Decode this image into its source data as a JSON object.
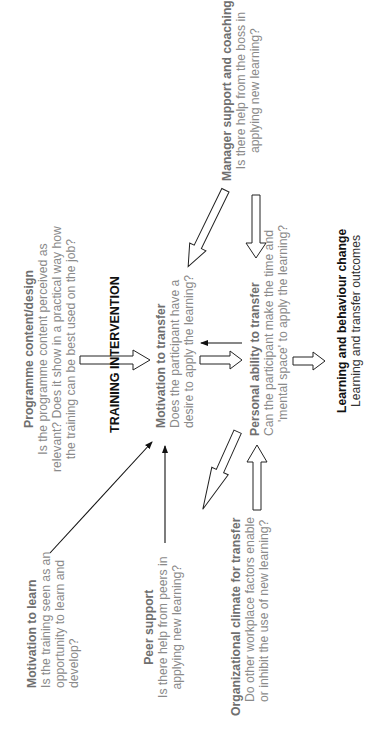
{
  "diagram": {
    "heading": "TRAINING INTERVENTION",
    "nodes": {
      "programme": {
        "title": "Programme content/design",
        "lines": [
          "Is the programme content perceived as",
          "relevant? Does it show in a practical way how",
          "the training can be best used on the job?"
        ]
      },
      "motivation_learn": {
        "title": "Motivation to learn",
        "lines": [
          "Is the training seen as an",
          "opportunity to learn and",
          "develop?"
        ]
      },
      "peer": {
        "title": "Peer support",
        "lines": [
          "Is there help from peers in",
          "applying new learning?"
        ]
      },
      "org_climate": {
        "title": "Organizational climate for transfer",
        "lines": [
          "Do other workplace factors enable",
          "or inhibit the use of new learning?"
        ]
      },
      "motivation_transfer": {
        "title": "Motivation to transfer",
        "lines": [
          "Does the participant have a",
          "desire to apply the learning?"
        ]
      },
      "personal": {
        "title": "Personal ability to transfer",
        "lines": [
          "Can the participant make the time and",
          "'mental space' to apply the learning?"
        ]
      },
      "manager": {
        "title": "Manager support and coaching",
        "lines": [
          "Is there help from the boss in",
          "applying new learning?"
        ]
      },
      "outcome": {
        "title": "Learning and behaviour change",
        "lines": [
          "Learning and transfer outcomes"
        ]
      }
    },
    "edges": [
      {
        "from": "programme",
        "to": "motivation_transfer",
        "style": "hollow"
      },
      {
        "from": "motivation_learn",
        "to": "motivation_transfer",
        "style": "thin"
      },
      {
        "from": "peer",
        "to": "motivation_transfer",
        "style": "thin"
      },
      {
        "from": "org_climate",
        "to": "motivation_transfer",
        "style": "hollow"
      },
      {
        "from": "org_climate",
        "to": "personal",
        "style": "hollow"
      },
      {
        "from": "manager",
        "to": "motivation_transfer",
        "style": "hollow"
      },
      {
        "from": "manager",
        "to": "personal",
        "style": "hollow"
      },
      {
        "from": "motivation_transfer",
        "to": "personal",
        "style": "hollow"
      },
      {
        "from": "personal",
        "to": "motivation_transfer",
        "style": "thin"
      },
      {
        "from": "personal",
        "to": "outcome",
        "style": "hollow"
      }
    ],
    "colors": {
      "title_gray": "#6f6f6f",
      "body_gray": "#8a8a8a",
      "dark": "#111111"
    }
  }
}
